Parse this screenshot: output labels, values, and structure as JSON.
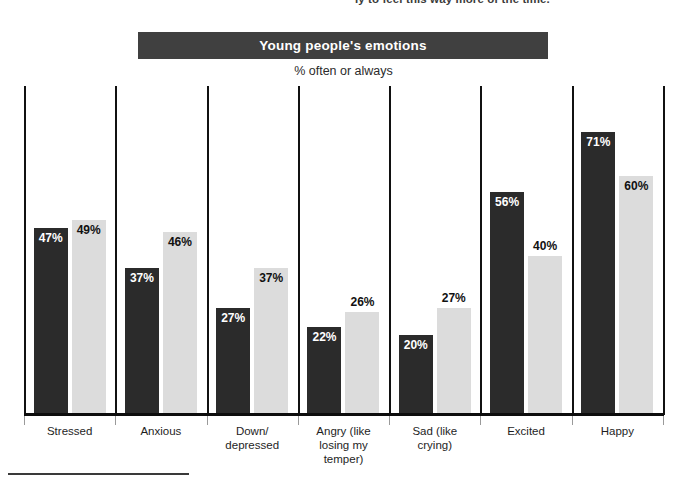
{
  "top_caption": {
    "left_fragment": "",
    "right_fragment": "ly to feel this way more of the time."
  },
  "title": "Young people's emotions",
  "subtitle": "% often or always",
  "chart_data": {
    "type": "bar",
    "title": "Young people's emotions",
    "subtitle": "% often or always",
    "xlabel": "",
    "ylabel": "",
    "ylim": [
      0,
      100
    ],
    "grid": false,
    "legend_position": "none",
    "value_suffix": "%",
    "categories": [
      "Stressed",
      "Anxious",
      "Down/\ndepressed",
      "Angry (like\nlosing my\ntemper)",
      "Sad (like\ncrying)",
      "Excited",
      "Happy"
    ],
    "series": [
      {
        "name": "Series 1",
        "color": "#2b2b2b",
        "values": [
          47,
          37,
          27,
          22,
          20,
          56,
          71
        ],
        "labels": [
          "47%",
          "37%",
          "27%",
          "22%",
          "20%",
          "56%",
          "71%"
        ]
      },
      {
        "name": "Series 2",
        "color": "#dcdcdc",
        "values": [
          49,
          46,
          37,
          26,
          27,
          40,
          60
        ],
        "labels": [
          "49%",
          "46%",
          "37%",
          "26%",
          "27%",
          "40%",
          "60%"
        ]
      }
    ]
  },
  "colors": {
    "series_dark": "#2b2b2b",
    "series_light": "#dcdcdc",
    "title_banner": "#404040",
    "axis": "#0d0d0d"
  }
}
